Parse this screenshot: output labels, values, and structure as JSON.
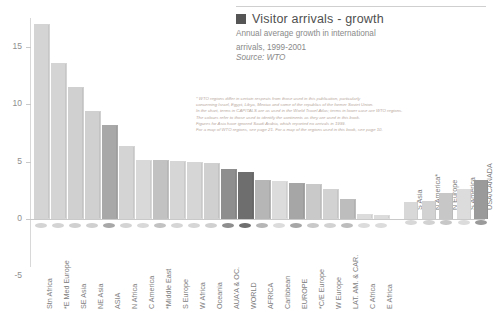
{
  "legend": {
    "swatch_color": "#555555",
    "title": "Visitor arrivals - growth",
    "subtitle_line1": "Annual average growth in international",
    "subtitle_line2": "arrivals, 1999-2001",
    "source": "Source: WTO"
  },
  "footnote": {
    "line1": "* WTO regions differ in certain respects from those used in this publication, particularly",
    "line2": "concerning Israel, Egypt, Libya, Mexico and some of the republics of the former Soviet Union.",
    "line3": "In the chart, terms in CAPITALS are as used in the World Travel Atlas; terms in lower case are WTO regions.",
    "line4": "The colours refer to those used to identify the continents as they are used in this book.",
    "line5": "Figures for Asia have ignored Saudi Arabia, which reported no arrivals in 1999.",
    "line6": "For a map of WTO regions, see page 21. For a map of the regions used in this book, see page 10."
  },
  "chart_data": {
    "type": "bar",
    "title": "Visitor arrivals - growth",
    "subtitle": "Annual average growth in international arrivals, 1999-2001",
    "source": "Source: WTO",
    "xlabel": "",
    "ylabel": "",
    "ylim": [
      -5,
      17.5
    ],
    "yticks": [
      -5,
      0,
      5,
      10,
      15
    ],
    "ytick_labels": [
      "-5",
      "0",
      "5",
      "10",
      "15"
    ],
    "grid": false,
    "legend_position": "top-right",
    "categories": [
      "Stn Africa",
      "*E Med Europe",
      "SE Asia",
      "NE Asia",
      "ASIA",
      "N Africa",
      "C America",
      "*Middle East",
      "S Europe",
      "W Africa",
      "Oceania",
      "AUA'A & OC.",
      "WORLD",
      "AFRICA",
      "Caribbean",
      "EUROPE",
      "*C/E Europe",
      "W Europe",
      "LAT. AM. & CAR.",
      "C Africa",
      "E Africa"
    ],
    "values": [
      16.8,
      13.4,
      11.3,
      9.2,
      8.0,
      6.2,
      5.0,
      5.0,
      4.9,
      4.8,
      4.7,
      4.2,
      3.9,
      3.2,
      3.1,
      3.0,
      2.9,
      2.4,
      1.6,
      0.3,
      0.2
    ],
    "bar_colors": [
      "#d4d4d4",
      "#d4d4d4",
      "#d0d0d0",
      "#d0d0d0",
      "#a8a8a8",
      "#d4d4d4",
      "#d9d9d9",
      "#c2c2c2",
      "#d6d6d6",
      "#d6d6d6",
      "#d0d0d0",
      "#8e8e8e",
      "#6e6e6e",
      "#b6b6b6",
      "#dcdcdc",
      "#a6a6a6",
      "#c9c9c9",
      "#d2d2d2",
      "#bdbdbd",
      "#dcdcdc",
      "#dcdcdc"
    ],
    "right_group": {
      "categories": [
        "S Asia",
        "N America*",
        "N Europe",
        "S America",
        "USA/CANADA"
      ],
      "values": [
        1.5,
        1.6,
        2.3,
        2.6,
        3.4
      ],
      "bar_colors": [
        "#d8d8d8",
        "#d2d2d2",
        "#c7c7c7",
        "#dcdcdc",
        "#9a9a9a"
      ]
    }
  }
}
